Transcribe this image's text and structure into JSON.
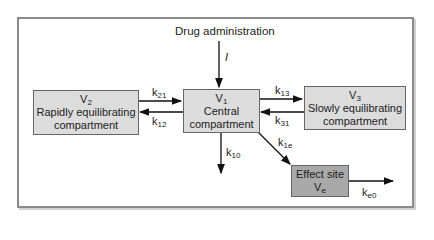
{
  "title": "Drug administration",
  "input_label": "I",
  "compartments": {
    "v1": {
      "symbol": "V",
      "sub": "1",
      "line1": "Central",
      "line2": "compartment"
    },
    "v2": {
      "symbol": "V",
      "sub": "2",
      "line1": "Rapidly equilibrating",
      "line2": "compartment"
    },
    "v3": {
      "symbol": "V",
      "sub": "3",
      "line1": "Slowly equilibrating",
      "line2": "compartment"
    },
    "ve": {
      "line1": "Effect site",
      "symbol": "V",
      "sub": "e"
    }
  },
  "rates": {
    "k21": {
      "k": "k",
      "sub": "21"
    },
    "k12": {
      "k": "k",
      "sub": "12"
    },
    "k13": {
      "k": "k",
      "sub": "13"
    },
    "k31": {
      "k": "k",
      "sub": "31"
    },
    "k10": {
      "k": "k",
      "sub": "10"
    },
    "k1e": {
      "k": "k",
      "sub": "1e"
    },
    "ke0": {
      "k": "k",
      "sub": "e0"
    }
  },
  "colors": {
    "box": "#dcdcdc",
    "effect_box": "#a9a9a9",
    "frame": "#8a8a8a"
  }
}
